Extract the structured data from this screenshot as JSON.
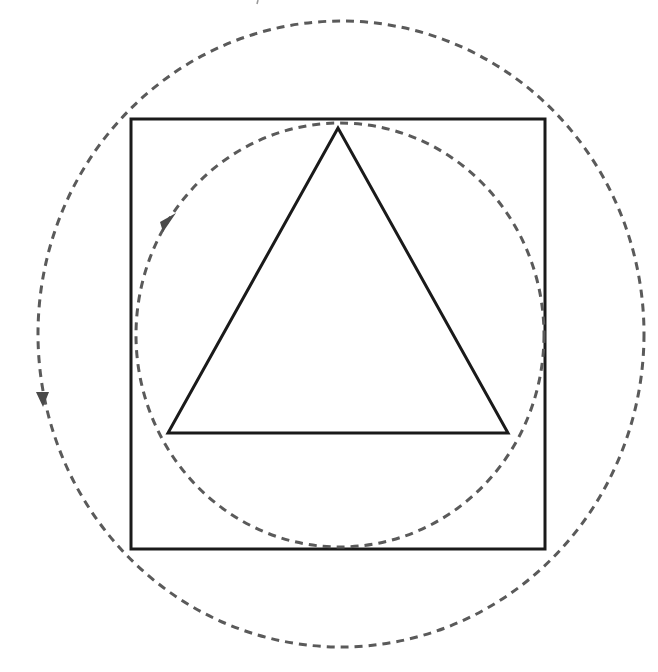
{
  "diagram": {
    "colors": {
      "background": "#ffffff",
      "solid_stroke": "#1a1a1a",
      "dashed_stroke": "#5a5a5a",
      "arrow_fill": "#4a4a4a"
    },
    "square": {
      "x": 131,
      "y": 119,
      "width": 414,
      "height": 430
    },
    "inner_circle": {
      "cx": 340,
      "cy": 335,
      "rx": 204,
      "ry": 212
    },
    "outer_circle": {
      "cx": 341,
      "cy": 334,
      "rx": 303,
      "ry": 313
    },
    "triangle": {
      "points": "338,128 168,433 508,433"
    },
    "arrows": [
      {
        "name": "inner-circle-arrow",
        "points": "160,222 176,213 163,232"
      },
      {
        "name": "outer-circle-arrow",
        "points": "36,392 49,392 43,407"
      }
    ]
  }
}
